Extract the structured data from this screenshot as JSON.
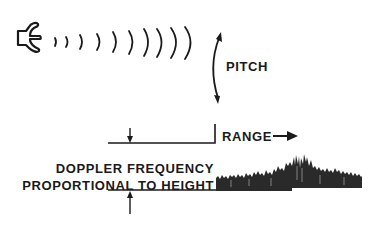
{
  "diagram": {
    "labels": {
      "pitch": "PITCH",
      "range": "RANGE",
      "doppler_line1": "DOPPLER FREQUENCY",
      "doppler_line2": "PROPORTIONAL TO HEIGHT"
    },
    "icons": {
      "source": "speaker-icon",
      "waves": "sound-wave-arcs",
      "pitch_arrow": "curved-double-arrow",
      "range_arrow": "right-arrow",
      "height_arrows": "dimension-arrows"
    },
    "wave_arc_count": 10,
    "colors": {
      "ink": "#1a1a1a",
      "background": "#ffffff"
    }
  }
}
